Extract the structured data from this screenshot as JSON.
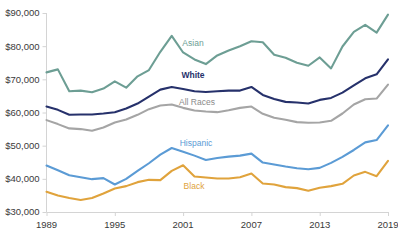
{
  "chart_data": {
    "type": "line",
    "title": "",
    "subtitle": "",
    "xlabel": "",
    "ylabel": "",
    "xlim": [
      1989,
      2019
    ],
    "ylim": [
      30000,
      90000
    ],
    "grid": false,
    "legend_position": "inline-labels",
    "y_tick_labels": [
      "$90,000",
      "$80,000",
      "$70,000",
      "$60,000",
      "$50,000",
      "$40,000",
      "$30,000"
    ],
    "y_tick_values": [
      90000,
      80000,
      70000,
      60000,
      50000,
      40000,
      30000
    ],
    "x_tick_labels": [
      "1989",
      "1995",
      "2001",
      "2007",
      "2013",
      "2019"
    ],
    "x_tick_values": [
      1989,
      1995,
      2001,
      2007,
      2013,
      2019
    ],
    "x": [
      1989,
      1990,
      1991,
      1992,
      1993,
      1994,
      1995,
      1996,
      1997,
      1998,
      1999,
      2000,
      2001,
      2002,
      2003,
      2004,
      2005,
      2006,
      2007,
      2008,
      2009,
      2010,
      2011,
      2012,
      2013,
      2014,
      2015,
      2016,
      2017,
      2018,
      2019
    ],
    "series": [
      {
        "name": "Asian",
        "color": "#6d9e94",
        "label_color": "#6d9e94",
        "label_bold": false,
        "values": [
          72100,
          73000,
          66400,
          66600,
          66100,
          67200,
          69400,
          67500,
          70900,
          72800,
          78300,
          83100,
          78100,
          76000,
          74600,
          77200,
          78700,
          80000,
          81500,
          81200,
          77400,
          76500,
          75000,
          74100,
          76600,
          73300,
          79900,
          84300,
          86400,
          84100,
          89500
        ]
      },
      {
        "name": "White",
        "color": "#26316b",
        "label_color": "#26316b",
        "label_bold": true,
        "values": [
          61800,
          60800,
          59300,
          59400,
          59400,
          59700,
          60100,
          61200,
          62700,
          64800,
          66900,
          67700,
          67100,
          66400,
          66200,
          66400,
          66600,
          66600,
          67700,
          65300,
          64100,
          63200,
          63000,
          62700,
          63800,
          64400,
          66000,
          68200,
          70300,
          71500,
          76000
        ]
      },
      {
        "name": "All Races",
        "color": "#a5a5a5",
        "label_color": "#8b8b8b",
        "label_bold": false,
        "values": [
          57700,
          56500,
          55200,
          55000,
          54500,
          55500,
          57000,
          57900,
          59300,
          61000,
          62100,
          62400,
          61400,
          60600,
          60300,
          60100,
          60700,
          61400,
          61800,
          59600,
          58400,
          57800,
          57100,
          56900,
          57000,
          57500,
          59700,
          62400,
          64000,
          64200,
          68400
        ]
      },
      {
        "name": "Hispanic",
        "color": "#5b9bd5",
        "label_color": "#5b9bd5",
        "label_bold": false,
        "values": [
          44000,
          42600,
          41100,
          40500,
          39900,
          40200,
          38300,
          40000,
          42400,
          44700,
          47300,
          49300,
          48200,
          47000,
          45700,
          46300,
          46700,
          47000,
          47600,
          44900,
          44300,
          43700,
          43200,
          42900,
          43300,
          44800,
          46600,
          48700,
          51000,
          51700,
          56100
        ]
      },
      {
        "name": "Black",
        "color": "#e0a33c",
        "label_color": "#e0a33c",
        "label_bold": false,
        "values": [
          36100,
          35000,
          34200,
          33600,
          34200,
          35600,
          37100,
          37800,
          39000,
          39700,
          39600,
          42400,
          44100,
          40700,
          40400,
          40100,
          40100,
          40500,
          41600,
          38600,
          38300,
          37500,
          37200,
          36400,
          37300,
          37800,
          38500,
          41000,
          42100,
          40800,
          45400
        ]
      }
    ],
    "series_label_positions": [
      {
        "name": "Asian",
        "x": 193,
        "y": 46
      },
      {
        "name": "White",
        "x": 193,
        "y": 78
      },
      {
        "name": "All Races",
        "x": 197,
        "y": 105
      },
      {
        "name": "Hispanic",
        "x": 196,
        "y": 146
      },
      {
        "name": "Black",
        "x": 194,
        "y": 189
      }
    ]
  }
}
